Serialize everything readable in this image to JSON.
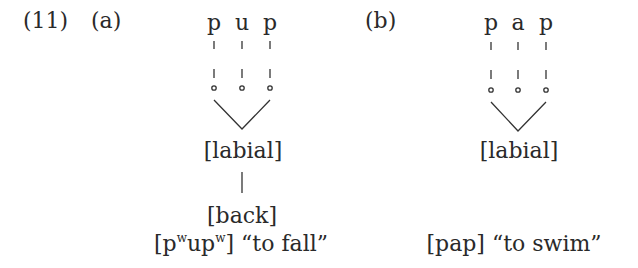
{
  "example": {
    "number": "(11)",
    "panels": [
      {
        "label": "(a)",
        "segments": [
          "p",
          "u",
          "p"
        ],
        "features": [
          "[labial]",
          "[back]"
        ],
        "gloss": {
          "open": "[p",
          "sup1": "w",
          "mid": "up",
          "sup2": "w",
          "close": "]",
          "meaning": "“to fall”"
        }
      },
      {
        "label": "(b)",
        "segments": [
          "p",
          "a",
          "p"
        ],
        "features": [
          "[labial]"
        ],
        "gloss": {
          "form": "[pap]",
          "meaning": "“to swim”"
        }
      }
    ]
  }
}
